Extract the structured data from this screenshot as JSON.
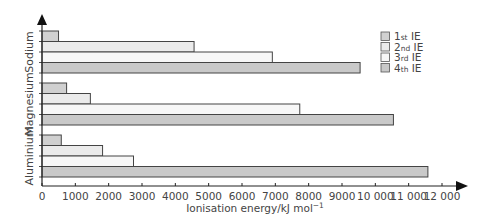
{
  "chart_data": {
    "type": "bar",
    "orientation": "horizontal",
    "title": "",
    "xlabel": "Ionisation energy/kJ mol⁻¹",
    "xlabel_main": "Ionisation energy/kJ mol",
    "xlabel_sup": "−1",
    "ylabel": "",
    "xlim": [
      0,
      12000
    ],
    "x_ticks": [
      0,
      1000,
      2000,
      3000,
      4000,
      5000,
      6000,
      7000,
      8000,
      9000,
      10000,
      11000,
      12000
    ],
    "x_tick_labels": [
      "0",
      "1000",
      "2000",
      "3000",
      "4000",
      "5000",
      "6000",
      "7000",
      "8000",
      "9000",
      "10 000",
      "11 000",
      "12 000"
    ],
    "grid": false,
    "legend_position": "top-right",
    "categories": [
      "Sodium",
      "Magnesium",
      "Aluminium"
    ],
    "series": [
      {
        "name": "1st IE",
        "num": "1",
        "suffix": "st",
        "color": "#d0d0d0",
        "values": [
          496,
          738,
          578
        ]
      },
      {
        "name": "2nd IE",
        "num": "2",
        "suffix": "nd",
        "color": "#ebebeb",
        "values": [
          4562,
          1451,
          1817
        ]
      },
      {
        "name": "3rd IE",
        "num": "3",
        "suffix": "rd",
        "color": "#f7f7f7",
        "values": [
          6910,
          7733,
          2745
        ]
      },
      {
        "name": "4th IE",
        "num": "4",
        "suffix": "th",
        "color": "#c9c9c9",
        "values": [
          9543,
          10543,
          11577
        ]
      }
    ]
  },
  "colors": {
    "axis": "#222222",
    "bar_stroke": "#444444",
    "text": "#444444"
  }
}
